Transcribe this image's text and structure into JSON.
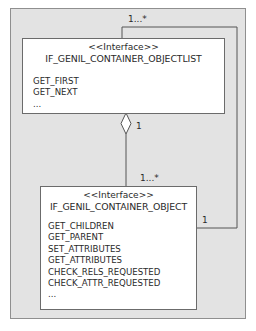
{
  "diagram": {
    "type": "uml-class-diagram",
    "classes": [
      {
        "id": "objectlist",
        "stereotype": "<<Interface>>",
        "name": "IF_GENIL_CONTAINER_OBJECTLIST",
        "operations": [
          "GET_FIRST",
          "GET_NEXT",
          "..."
        ]
      },
      {
        "id": "object",
        "stereotype": "<<Interface>>",
        "name": "IF_GENIL_CONTAINER_OBJECT",
        "operations": [
          "GET_CHILDREN",
          "GET_PARENT",
          "SET_ATTRIBUTES",
          "GET_ATTRIBUTES",
          "CHECK_RELS_REQUESTED",
          "CHECK_ATTR_REQUESTED",
          "..."
        ]
      }
    ],
    "associations": [
      {
        "kind": "aggregation",
        "from": "objectlist",
        "to": "object",
        "from_multiplicity": "1",
        "to_multiplicity": "1...*"
      },
      {
        "kind": "association",
        "from": "object",
        "to": "objectlist",
        "from_multiplicity": "1",
        "to_multiplicity": "1...*"
      }
    ],
    "colors": {
      "frame_background": "#e3e3e3",
      "box_background": "#ffffff",
      "line": "#555555"
    }
  }
}
